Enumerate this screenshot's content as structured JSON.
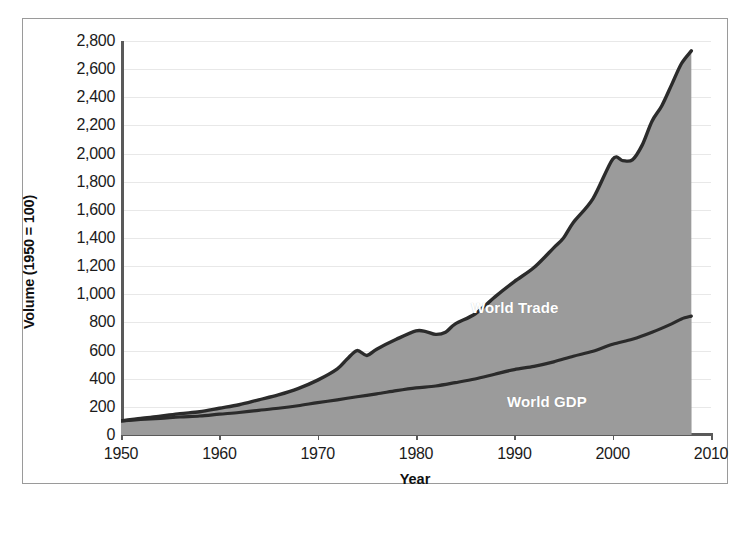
{
  "chart_data": {
    "type": "area",
    "title": "",
    "xlabel": "Year",
    "ylabel": "Volume (1950 = 100)",
    "xlim": [
      1950,
      2010
    ],
    "ylim": [
      0,
      2800
    ],
    "xticks": [
      1950,
      1960,
      1970,
      1980,
      1990,
      2000,
      2010
    ],
    "xtick_labels": [
      "1950",
      "1960",
      "1970",
      "1980",
      "1990",
      "2000",
      "2010"
    ],
    "yticks": [
      0,
      200,
      400,
      600,
      800,
      1000,
      1200,
      1400,
      1600,
      1800,
      2000,
      2200,
      2400,
      2600,
      2800
    ],
    "ytick_labels": [
      "0",
      "200",
      "400",
      "600",
      "800",
      "1,000",
      "1,200",
      "1,400",
      "1,600",
      "1,800",
      "2,000",
      "2,200",
      "2,400",
      "2,600",
      "2,800"
    ],
    "grid": true,
    "legend_position": "inline-annotation",
    "fill_color": "#9b9b9b",
    "line_color": "#2b2b2b",
    "label_color": "#ffffff",
    "gridline_color": "#e8e8e8",
    "axis_color": "#5a5a5a",
    "series": [
      {
        "name": "World Trade",
        "label": "World Trade",
        "x": [
          1950,
          1952,
          1954,
          1956,
          1958,
          1960,
          1962,
          1964,
          1966,
          1968,
          1970,
          1972,
          1973,
          1974,
          1975,
          1976,
          1978,
          1980,
          1981,
          1982,
          1983,
          1984,
          1986,
          1988,
          1990,
          1992,
          1994,
          1995,
          1996,
          1998,
          2000,
          2001,
          2002,
          2003,
          2004,
          2005,
          2006,
          2007,
          2008
        ],
        "values": [
          100,
          118,
          133,
          152,
          165,
          190,
          215,
          250,
          285,
          330,
          390,
          470,
          540,
          600,
          565,
          610,
          680,
          740,
          735,
          715,
          730,
          790,
          860,
          980,
          1090,
          1190,
          1330,
          1400,
          1510,
          1680,
          1960,
          1950,
          1955,
          2060,
          2230,
          2340,
          2490,
          2640,
          2730
        ]
      },
      {
        "name": "World GDP",
        "label": "World GDP",
        "x": [
          1950,
          1952,
          1954,
          1956,
          1958,
          1960,
          1962,
          1964,
          1966,
          1968,
          1970,
          1972,
          1974,
          1976,
          1978,
          1980,
          1982,
          1984,
          1986,
          1988,
          1990,
          1992,
          1994,
          1996,
          1998,
          2000,
          2002,
          2004,
          2006,
          2007,
          2008
        ],
        "values": [
          100,
          110,
          118,
          128,
          135,
          148,
          160,
          175,
          190,
          208,
          230,
          250,
          272,
          292,
          315,
          335,
          348,
          372,
          398,
          432,
          465,
          488,
          520,
          560,
          595,
          645,
          680,
          730,
          790,
          825,
          845
        ]
      }
    ]
  },
  "axis": {
    "y_title": "Volume (1950 = 100)",
    "x_title": "Year"
  }
}
